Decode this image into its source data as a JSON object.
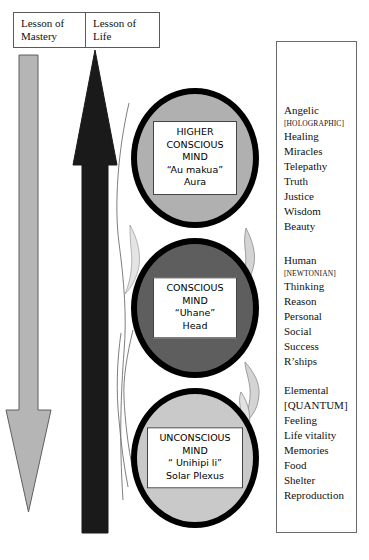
{
  "header": {
    "boxes": [
      {
        "label": "Lesson of Mastery"
      },
      {
        "label": "Lesson of Life"
      }
    ]
  },
  "arrows": [
    {
      "name": "lesson-of-mastery-arrow",
      "direction": "down",
      "color": "#b5b5b5"
    },
    {
      "name": "lesson-of-life-arrow",
      "direction": "up",
      "color": "#1a1a1a"
    }
  ],
  "circles": [
    {
      "id": "higher-conscious-mind",
      "fill": "#b0b0b0",
      "lines": [
        "HIGHER",
        "CONSCIOUS",
        "MIND",
        "“Au makua”",
        "Aura"
      ]
    },
    {
      "id": "conscious-mind",
      "fill": "#5e5e5e",
      "lines": [
        "CONSCIOUS",
        "MIND",
        "“Uhane”",
        "Head"
      ]
    },
    {
      "id": "unconscious-mind",
      "fill": "#c9c9c9",
      "lines": [
        "UNCONSCIOUS",
        "MIND",
        "“ Unihipi li”",
        "Solar Plexus"
      ]
    }
  ],
  "attributes": {
    "groups": [
      {
        "id": "angelic-group",
        "items": [
          {
            "text": "Angelic",
            "tag": false
          },
          {
            "text": "[HOLOGRAPHIC]",
            "tag": true
          },
          {
            "text": "Healing",
            "tag": false
          },
          {
            "text": "Miracles",
            "tag": false
          },
          {
            "text": "Telepathy",
            "tag": false
          },
          {
            "text": "Truth",
            "tag": false
          },
          {
            "text": "Justice",
            "tag": false
          },
          {
            "text": "Wisdom",
            "tag": false
          },
          {
            "text": "Beauty",
            "tag": false
          }
        ]
      },
      {
        "id": "human-group",
        "items": [
          {
            "text": "Human",
            "tag": false
          },
          {
            "text": "[NEWTONIAN]",
            "tag": true
          },
          {
            "text": "Thinking",
            "tag": false
          },
          {
            "text": "Reason",
            "tag": false
          },
          {
            "text": "Personal",
            "tag": false
          },
          {
            "text": "Social",
            "tag": false
          },
          {
            "text": "Success",
            "tag": false
          },
          {
            "text": "R’ships",
            "tag": false
          }
        ]
      },
      {
        "id": "elemental-group",
        "items": [
          {
            "text": "Elemental",
            "tag": false
          },
          {
            "text": "[QUANTUM]",
            "tag": false
          },
          {
            "text": "Feeling",
            "tag": false
          },
          {
            "text": "Life vitality",
            "tag": false
          },
          {
            "text": "Memories",
            "tag": false
          },
          {
            "text": "Food",
            "tag": false
          },
          {
            "text": "Shelter",
            "tag": false
          },
          {
            "text": "Reproduction",
            "tag": false
          }
        ]
      }
    ]
  }
}
